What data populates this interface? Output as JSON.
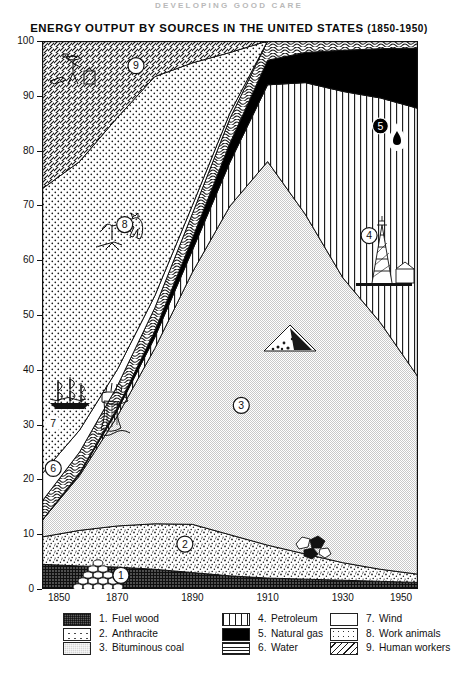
{
  "page": {
    "running_head": "DEVELOPING GOOD CARE",
    "title_main": "ENERGY OUTPUT BY SOURCES IN THE UNITED STATES",
    "title_years": "(1850-1950)"
  },
  "axes": {
    "y_ticks": [
      0,
      10,
      20,
      30,
      40,
      50,
      60,
      70,
      80,
      90,
      100
    ],
    "y_min": 0,
    "y_max": 100,
    "x_ticks": [
      1850,
      1870,
      1890,
      1910,
      1930,
      1950
    ],
    "x_min": 1850,
    "x_max": 1950
  },
  "legend": {
    "columns": [
      {
        "items": [
          {
            "num": "1.",
            "label": "Fuel wood",
            "swatch": "sw-fuelwood"
          },
          {
            "num": "2.",
            "label": "Anthracite",
            "swatch": "sw-anthracite"
          },
          {
            "num": "3.",
            "label": "Bituminous coal",
            "swatch": "sw-bitum"
          }
        ]
      },
      {
        "items": [
          {
            "num": "4.",
            "label": "Petroleum",
            "swatch": "sw-petrol"
          },
          {
            "num": "5.",
            "label": "Natural gas",
            "swatch": "sw-gas"
          },
          {
            "num": "6.",
            "label": "Water",
            "swatch": "sw-water"
          }
        ]
      },
      {
        "items": [
          {
            "num": "7.",
            "label": "Wind",
            "swatch": "sw-wind"
          },
          {
            "num": "8.",
            "label": "Work animals",
            "swatch": "sw-animals"
          },
          {
            "num": "9.",
            "label": "Human workers",
            "swatch": "sw-human"
          }
        ]
      }
    ]
  },
  "callouts": [
    {
      "id": "1",
      "label": "1",
      "x": 1871,
      "y": 2.5
    },
    {
      "id": "2",
      "label": "2",
      "x": 1888,
      "y": 8.2
    },
    {
      "id": "3",
      "label": "3",
      "x": 1903,
      "y": 33.5
    },
    {
      "id": "4",
      "label": "4",
      "x": 1937,
      "y": 64.5
    },
    {
      "id": "5",
      "label": "5",
      "x": 1940,
      "y": 84.5
    },
    {
      "id": "6",
      "label": "6",
      "x": 1853,
      "y": 22.0
    },
    {
      "id": "7",
      "label": "7",
      "x": 1853,
      "y": 30.2
    },
    {
      "id": "8",
      "label": "8",
      "x": 1872,
      "y": 66.5
    },
    {
      "id": "9",
      "label": "9",
      "x": 1875,
      "y": 95.5
    }
  ],
  "chart_data": {
    "type": "area",
    "stacked": true,
    "title": "ENERGY OUTPUT BY SOURCES IN THE UNITED STATES (1850-1950)",
    "xlabel": "",
    "ylabel": "",
    "xlim": [
      1850,
      1950
    ],
    "ylim": [
      0,
      100
    ],
    "grid": false,
    "legend_position": "bottom",
    "units": "percent of total energy output",
    "x": [
      1850,
      1860,
      1870,
      1880,
      1890,
      1900,
      1910,
      1920,
      1930,
      1940,
      1950
    ],
    "series": [
      {
        "name": "Fuel wood",
        "num": 1,
        "pattern": "dark-checker",
        "values": [
          4.5,
          4.2,
          4.0,
          3.6,
          3.0,
          2.4,
          2.0,
          1.8,
          1.6,
          1.4,
          1.2
        ]
      },
      {
        "name": "Anthracite",
        "num": 2,
        "pattern": "speckled",
        "values": [
          5.0,
          6.5,
          7.5,
          8.3,
          8.8,
          7.5,
          6.0,
          4.6,
          3.2,
          2.2,
          1.5
        ]
      },
      {
        "name": "Bituminous coal",
        "num": 3,
        "pattern": "light-gray",
        "values": [
          3.0,
          10.0,
          20.0,
          32.0,
          46.0,
          60.0,
          70.0,
          62.0,
          52.0,
          45.0,
          36.0
        ]
      },
      {
        "name": "Petroleum",
        "num": 4,
        "pattern": "vertical-lines",
        "values": [
          0.0,
          0.3,
          1.0,
          2.0,
          4.0,
          8.0,
          14.0,
          24.0,
          34.0,
          41.0,
          49.0
        ]
      },
      {
        "name": "Natural gas",
        "num": 5,
        "pattern": "solid-black",
        "values": [
          0.0,
          0.2,
          0.5,
          1.2,
          2.2,
          3.5,
          4.5,
          5.5,
          7.5,
          9.0,
          11.0
        ]
      },
      {
        "name": "Water",
        "num": 6,
        "pattern": "wavy-lines",
        "values": [
          3.5,
          3.8,
          4.0,
          4.2,
          4.5,
          4.5,
          3.5,
          2.1,
          1.7,
          1.4,
          1.3
        ]
      },
      {
        "name": "Wind",
        "num": 7,
        "pattern": "white",
        "values": [
          5.0,
          4.0,
          3.0,
          2.2,
          1.5,
          1.0,
          0.0,
          0.0,
          0.0,
          0.0,
          0.0
        ]
      },
      {
        "name": "Work animals",
        "num": 8,
        "pattern": "dotted",
        "values": [
          52.0,
          49.0,
          46.0,
          40.0,
          26.0,
          11.0,
          0.0,
          0.0,
          0.0,
          0.0,
          0.0
        ]
      },
      {
        "name": "Human workers",
        "num": 9,
        "pattern": "diagonal-hatch",
        "values": [
          27.0,
          22.0,
          14.0,
          6.5,
          4.0,
          2.1,
          0.0,
          0.0,
          0.0,
          0.0,
          0.0
        ]
      }
    ]
  }
}
